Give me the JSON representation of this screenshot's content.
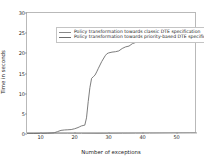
{
  "chart_data": {
    "type": "line",
    "title": "",
    "xlabel": "Number of exceptions",
    "ylabel": "Time in seconds",
    "xlim": [
      6,
      56
    ],
    "ylim": [
      0,
      30
    ],
    "xticks": [
      10,
      20,
      30,
      40,
      50
    ],
    "yticks": [
      0,
      5,
      10,
      15,
      20,
      25,
      30
    ],
    "grid": false,
    "legend_position": "upper left",
    "series": [
      {
        "name": "Policy transformation towards classic DTE specification",
        "color": "#8a8a8a",
        "x": [
          6,
          10,
          14,
          18,
          22,
          26,
          30,
          34,
          38,
          42,
          46,
          50,
          54,
          56
        ],
        "values": [
          0.05,
          0.06,
          0.07,
          0.08,
          0.1,
          0.12,
          0.14,
          0.16,
          0.18,
          0.2,
          0.22,
          0.24,
          0.26,
          0.27
        ]
      },
      {
        "name": "Policy transformation towards priority-based DTE specification",
        "color": "#6e6e6e",
        "x": [
          6,
          8,
          10,
          12,
          14,
          15,
          16,
          17,
          18,
          19,
          20,
          21,
          21.5,
          22,
          22.5,
          23,
          23.5,
          24,
          24.5,
          25,
          25.5,
          26,
          26.5,
          27,
          28,
          29,
          29.5,
          30,
          31,
          32,
          33,
          34,
          35,
          36,
          37,
          38,
          39,
          40,
          41,
          42,
          43,
          44,
          45,
          46,
          47,
          48,
          49,
          50,
          51,
          52,
          53,
          54,
          55,
          56
        ],
        "values": [
          0.1,
          0.12,
          0.15,
          0.2,
          0.3,
          0.6,
          0.9,
          1.0,
          1.05,
          1.1,
          1.3,
          1.6,
          1.8,
          2.0,
          2.1,
          2.2,
          4.0,
          8.0,
          11.5,
          13.8,
          14.2,
          14.6,
          15.4,
          16.3,
          18.0,
          19.4,
          19.9,
          20.1,
          20.3,
          20.4,
          20.6,
          21.2,
          21.6,
          21.8,
          22.4,
          22.7,
          22.9,
          23.3,
          23.6,
          23.8,
          24.0,
          24.3,
          24.5,
          24.7,
          24.9,
          25.0,
          25.2,
          25.4,
          25.5,
          25.5,
          25.5,
          25.5,
          25.5,
          25.5
        ]
      }
    ]
  },
  "legend": {
    "items": [
      "Policy transformation towards classic DTE specification",
      "Policy transformation towards priority-based DTE specification"
    ]
  }
}
